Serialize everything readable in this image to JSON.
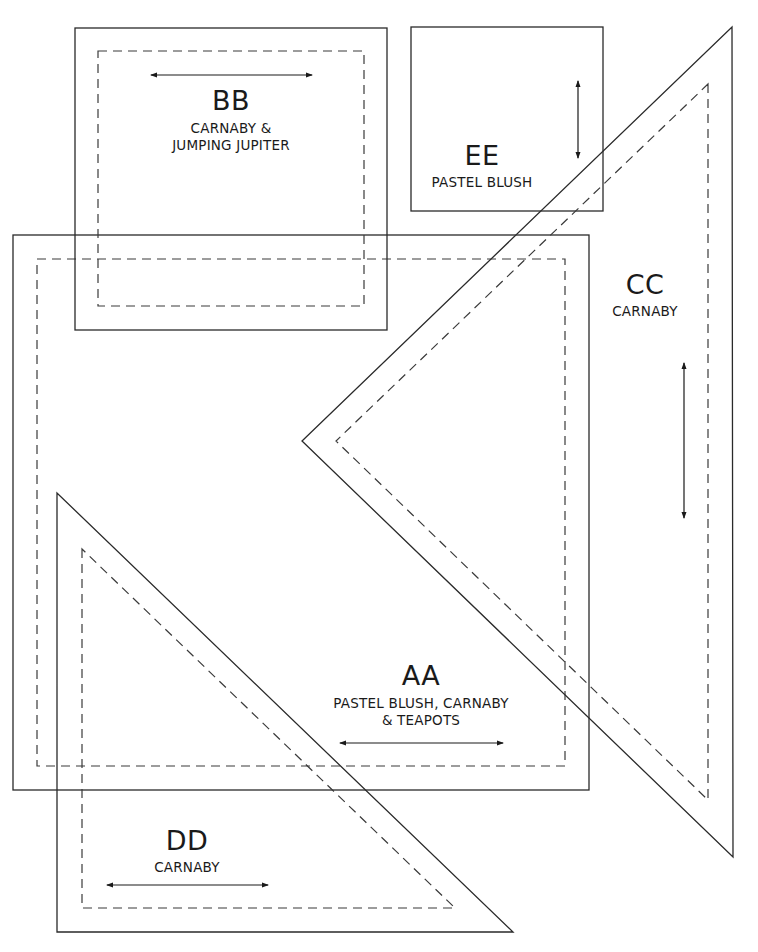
{
  "pieces": [
    {
      "id": "BB",
      "code": "BB",
      "fabric_line1": "CARNABY &",
      "fabric_line2": "JUMPING JUPITER",
      "shape": "square",
      "grain": "horizontal"
    },
    {
      "id": "EE",
      "code": "EE",
      "fabric_line1": "PASTEL BLUSH",
      "shape": "square",
      "grain": "vertical"
    },
    {
      "id": "CC",
      "code": "CC",
      "fabric_line1": "CARNABY",
      "shape": "triangle",
      "grain": "vertical"
    },
    {
      "id": "AA",
      "code": "AA",
      "fabric_line1": "PASTEL BLUSH, CARNABY",
      "fabric_line2": "& TEAPOTS",
      "shape": "rectangle",
      "grain": "horizontal"
    },
    {
      "id": "DD",
      "code": "DD",
      "fabric_line1": "CARNABY",
      "shape": "triangle",
      "grain": "horizontal"
    }
  ],
  "legend": {
    "solid_line": "cutting line",
    "dashed_line": "seam line",
    "arrow": "grain direction"
  },
  "colors": {
    "line": "#2a2a2a",
    "background": "#ffffff"
  }
}
